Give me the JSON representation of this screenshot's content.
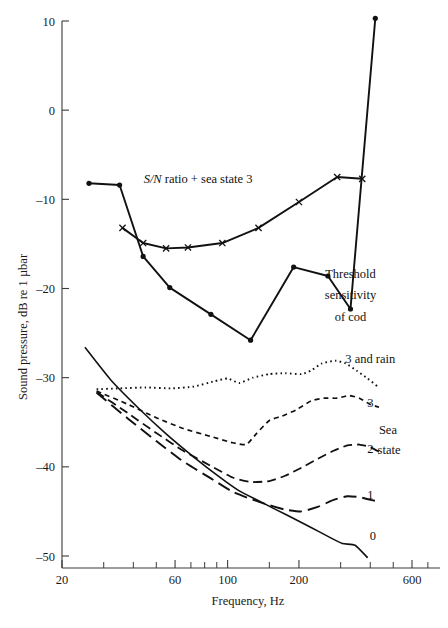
{
  "chart_data": {
    "type": "line",
    "title": "",
    "xlabel": "Frequency, Hz",
    "ylabel": "Sound pressure, dB re 1 µbar",
    "xscale": "log",
    "xlim": [
      20,
      700
    ],
    "ylim": [
      -52,
      11
    ],
    "grid": false,
    "legend_position": "inline-annotations",
    "xticks": [
      20,
      60,
      100,
      200,
      600
    ],
    "xtick_labels": [
      "20",
      "60",
      "100",
      "200",
      "600"
    ],
    "xminor_ticks": [
      30,
      40,
      50,
      70,
      80,
      90,
      150,
      300,
      400,
      500,
      700
    ],
    "yticks": [
      10,
      0,
      -10,
      -20,
      -30,
      -40,
      -50
    ],
    "ytick_labels": [
      "10",
      "0",
      "–10",
      "–20",
      "–30",
      "–40",
      "–50"
    ],
    "annotations": [
      {
        "id": "sn-ratio-label",
        "text": "S/N ratio + sea state 3",
        "x": 75,
        "y": -8.2,
        "style": "italic-prefix"
      },
      {
        "id": "threshold-label-1",
        "text": "Threshold",
        "x": 330,
        "y": -18.8
      },
      {
        "id": "threshold-label-2",
        "text": "sensitivity",
        "x": 330,
        "y": -21.2
      },
      {
        "id": "threshold-label-3",
        "text": "of cod",
        "x": 330,
        "y": -23.6
      },
      {
        "id": "sea-state-3-rain-label",
        "text": "3 and rain",
        "x": 400,
        "y": -28.4
      },
      {
        "id": "sea-state-3-label",
        "text": "3",
        "x": 400,
        "y": -33.3
      },
      {
        "id": "sea-state-caption-1",
        "text": "Sea",
        "x": 475,
        "y": -36.3
      },
      {
        "id": "sea-state-caption-2",
        "text": "state",
        "x": 480,
        "y": -38.6
      },
      {
        "id": "sea-state-2-label",
        "text": "2",
        "x": 400,
        "y": -38.4
      },
      {
        "id": "sea-state-1-label",
        "text": "1",
        "x": 400,
        "y": -43.6
      },
      {
        "id": "sea-state-0-label",
        "text": "0",
        "x": 410,
        "y": -48.2
      }
    ],
    "series": [
      {
        "name": "S/N ratio + sea state 3",
        "marker": "x",
        "style": "solid",
        "points": [
          [
            36,
            -13.2
          ],
          [
            44,
            -14.9
          ],
          [
            55,
            -15.5
          ],
          [
            68,
            -15.4
          ],
          [
            95,
            -14.9
          ],
          [
            135,
            -13.2
          ],
          [
            200,
            -10.3
          ],
          [
            290,
            -7.5
          ],
          [
            370,
            -7.7
          ]
        ]
      },
      {
        "name": "Threshold sensitivity of cod",
        "marker": "dot",
        "style": "solid",
        "points": [
          [
            26,
            -8.2
          ],
          [
            35,
            -8.4
          ],
          [
            44,
            -16.4
          ],
          [
            57,
            -19.9
          ],
          [
            85,
            -22.9
          ],
          [
            125,
            -25.8
          ],
          [
            190,
            -17.6
          ],
          [
            265,
            -18.6
          ],
          [
            330,
            -22.3
          ],
          [
            420,
            10.3
          ]
        ]
      },
      {
        "name": "Sea state 3 and rain",
        "marker": "none",
        "style": "dotted",
        "points": [
          [
            28,
            -31.3
          ],
          [
            35,
            -31.2
          ],
          [
            45,
            -31.1
          ],
          [
            58,
            -31.2
          ],
          [
            72,
            -31.0
          ],
          [
            88,
            -30.4
          ],
          [
            100,
            -30.1
          ],
          [
            112,
            -30.6
          ],
          [
            128,
            -30.0
          ],
          [
            150,
            -29.6
          ],
          [
            175,
            -29.5
          ],
          [
            205,
            -29.6
          ],
          [
            225,
            -29.2
          ],
          [
            250,
            -28.4
          ],
          [
            285,
            -28.1
          ],
          [
            315,
            -28.4
          ],
          [
            350,
            -29.2
          ],
          [
            390,
            -30.1
          ],
          [
            430,
            -31.0
          ]
        ]
      },
      {
        "name": "Sea state 3",
        "marker": "none",
        "style": "dashed-short",
        "points": [
          [
            28,
            -31.5
          ],
          [
            38,
            -33.0
          ],
          [
            50,
            -34.5
          ],
          [
            65,
            -35.7
          ],
          [
            85,
            -36.6
          ],
          [
            105,
            -37.3
          ],
          [
            120,
            -37.5
          ],
          [
            132,
            -36.3
          ],
          [
            150,
            -34.8
          ],
          [
            170,
            -34.3
          ],
          [
            195,
            -33.6
          ],
          [
            225,
            -32.6
          ],
          [
            255,
            -32.3
          ],
          [
            290,
            -32.3
          ],
          [
            325,
            -32.0
          ],
          [
            360,
            -32.3
          ],
          [
            400,
            -33.0
          ],
          [
            435,
            -33.3
          ]
        ]
      },
      {
        "name": "Sea state 2",
        "marker": "none",
        "style": "dashed-medium",
        "points": [
          [
            28,
            -31.6
          ],
          [
            38,
            -34.0
          ],
          [
            50,
            -36.2
          ],
          [
            65,
            -38.2
          ],
          [
            85,
            -39.9
          ],
          [
            105,
            -41.2
          ],
          [
            125,
            -41.7
          ],
          [
            150,
            -41.6
          ],
          [
            175,
            -41.0
          ],
          [
            205,
            -40.1
          ],
          [
            240,
            -39.1
          ],
          [
            280,
            -38.2
          ],
          [
            320,
            -37.6
          ],
          [
            360,
            -37.5
          ],
          [
            400,
            -37.8
          ],
          [
            435,
            -38.3
          ]
        ]
      },
      {
        "name": "Sea state 1",
        "marker": "none",
        "style": "dashed-long",
        "points": [
          [
            28,
            -31.7
          ],
          [
            38,
            -34.6
          ],
          [
            50,
            -37.1
          ],
          [
            65,
            -39.4
          ],
          [
            85,
            -41.3
          ],
          [
            105,
            -42.8
          ],
          [
            125,
            -43.6
          ],
          [
            150,
            -44.3
          ],
          [
            175,
            -44.8
          ],
          [
            205,
            -45.0
          ],
          [
            240,
            -44.5
          ],
          [
            280,
            -43.7
          ],
          [
            320,
            -43.3
          ],
          [
            360,
            -43.4
          ],
          [
            400,
            -43.7
          ],
          [
            435,
            -43.9
          ]
        ]
      },
      {
        "name": "Sea state 0",
        "marker": "none",
        "style": "solid-thin",
        "points": [
          [
            25,
            -26.6
          ],
          [
            32,
            -30.2
          ],
          [
            42,
            -33.4
          ],
          [
            55,
            -36.3
          ],
          [
            72,
            -38.9
          ],
          [
            92,
            -41.1
          ],
          [
            112,
            -42.7
          ],
          [
            135,
            -43.8
          ],
          [
            160,
            -44.8
          ],
          [
            190,
            -45.8
          ],
          [
            225,
            -46.8
          ],
          [
            265,
            -47.8
          ],
          [
            305,
            -48.6
          ],
          [
            345,
            -48.8
          ],
          [
            390,
            -50.2
          ]
        ]
      }
    ]
  },
  "figure": {
    "ylabel_text": "Sound pressure, dB re 1 µbar",
    "xlabel_text": "Frequency, Hz"
  }
}
